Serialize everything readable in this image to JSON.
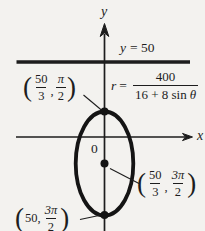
{
  "colors": {
    "background": "#f3f2ef",
    "ink": "#1d1d1d"
  },
  "axes": {
    "y_label": "y",
    "x_label": "x",
    "origin_label": "0"
  },
  "directrix": {
    "var": "y",
    "rest": "= 50"
  },
  "equation": {
    "var": "r",
    "equals": "=",
    "numerator": "400",
    "den_pre": "16 + 8 sin",
    "den_var": "θ"
  },
  "point_labels": {
    "top_vertex": {
      "open": "(",
      "r_num": "50",
      "r_den": "3",
      "sep": ",",
      "t_num": "π",
      "t_den": "2",
      "close": ")"
    },
    "center": {
      "open": "(",
      "r_num": "50",
      "r_den": "3",
      "sep": ",",
      "t_num": "3π",
      "t_den": "2",
      "close": ")"
    },
    "bottom_vertex": {
      "open": "(",
      "r_text": "50,",
      "t_num": "3π",
      "t_den": "2",
      "close": ")"
    }
  }
}
